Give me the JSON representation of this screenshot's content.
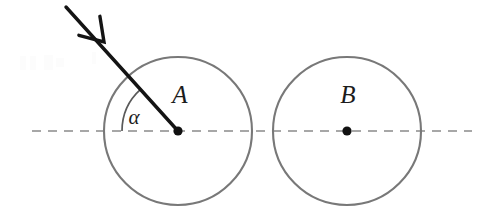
{
  "figure": {
    "kind": "physics-collision-diagram",
    "background_color": "#ffffff",
    "width": 495,
    "height": 222
  },
  "axis": {
    "name": "horizontal-centre-line",
    "style": "dashed",
    "color": "#8a8a8a",
    "stroke_width": 1.6,
    "dash_pattern": "9 7",
    "y": 131,
    "x_start": 32,
    "x_end": 472
  },
  "circles": [
    {
      "id": "A",
      "label": "A",
      "label_x": 180,
      "label_y": 103,
      "center_x": 178,
      "center_y": 131,
      "radius": 74,
      "stroke_color": "#787878",
      "stroke_width": 2.1,
      "fill": "none",
      "centre_dot_radius": 4.6,
      "centre_dot_color": "#111111"
    },
    {
      "id": "B",
      "label": "B",
      "label_x": 348,
      "label_y": 103,
      "center_x": 347,
      "center_y": 131,
      "radius": 74,
      "stroke_color": "#787878",
      "stroke_width": 2.1,
      "fill": "none",
      "centre_dot_radius": 4.6,
      "centre_dot_color": "#111111"
    }
  ],
  "incoming_ray": {
    "name": "incoming-velocity-arrow",
    "color": "#141414",
    "stroke_width": 3.4,
    "start_x": 66,
    "start_y": 7,
    "end_x": 178,
    "end_y": 131,
    "angle_from_axis_deg": 46,
    "arrowhead": {
      "style": "open-v",
      "vertex_x": 104,
      "vertex_y": 42,
      "barb_length": 26,
      "barb_half_angle_deg": 33,
      "stroke_width": 3.4
    }
  },
  "angle_mark": {
    "name": "impact-angle-arc",
    "symbol": "α",
    "label_x": 134,
    "label_y": 124,
    "arc_radius": 56,
    "arc_color": "#5a5a5a",
    "arc_stroke_width": 1.7,
    "start_angle_deg": 180,
    "end_angle_deg": 132,
    "vertex_x": 178,
    "vertex_y": 131
  }
}
